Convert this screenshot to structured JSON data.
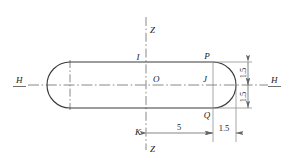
{
  "figure": {
    "colors": {
      "outline": "#333333",
      "centerline": "#777777",
      "dimension": "#666666",
      "text": "#1a1a1a",
      "background": "#ffffff"
    },
    "axes": [
      {
        "name": "z-axis-top",
        "label": "Z"
      },
      {
        "name": "z-axis-bottom",
        "label": "Z"
      },
      {
        "name": "h-axis-left",
        "label": "H"
      },
      {
        "name": "h-axis-right",
        "label": "H"
      }
    ],
    "points": [
      {
        "id": "I",
        "label": "I",
        "desc": "top of vertical Z axis on upper edge"
      },
      {
        "id": "O",
        "label": "O",
        "desc": "centroid at intersection of H and Z axes"
      },
      {
        "id": "K",
        "label": "K",
        "desc": "bottom of vertical Z axis at dimension line"
      },
      {
        "id": "P",
        "label": "P",
        "desc": "upper right tangent point"
      },
      {
        "id": "J",
        "label": "J",
        "desc": "center of right arc on H axis"
      },
      {
        "id": "Q",
        "label": "Q",
        "desc": "lower right tangent point"
      }
    ],
    "dimensions": [
      {
        "name": "horizontal-5",
        "value": "5",
        "orientation": "horizontal",
        "from": "K",
        "to": "J"
      },
      {
        "name": "horizontal-1-5",
        "value": "1.5",
        "orientation": "horizontal",
        "from": "J",
        "to": "right-extreme"
      },
      {
        "name": "vertical-1-5-upper",
        "value": "1.5",
        "orientation": "vertical",
        "from": "H-axis",
        "to": "top-edge"
      },
      {
        "name": "vertical-1-5-lower",
        "value": "1.5",
        "orientation": "vertical",
        "from": "bottom-edge",
        "to": "H-axis"
      }
    ]
  }
}
